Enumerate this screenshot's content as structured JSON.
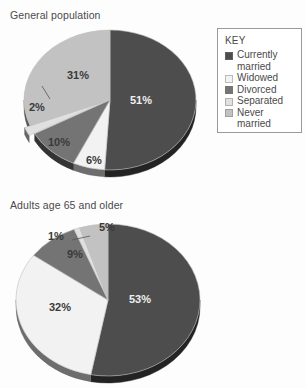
{
  "document": {
    "background": "#fdfdfd"
  },
  "legend": {
    "name": "KEY",
    "title": "KEY",
    "items": [
      {
        "label": "Currently",
        "label2": "married",
        "full": "Currently married",
        "color": "#4d4d4d",
        "icon": "legend-swatch-currently-married"
      },
      {
        "label": "Widowed",
        "label2": "",
        "full": "Widowed",
        "color": "#f2f2f2",
        "icon": "legend-swatch-widowed"
      },
      {
        "label": "Divorced",
        "label2": "",
        "full": "Divorced",
        "color": "#747474",
        "icon": "legend-swatch-divorced"
      },
      {
        "label": "Separated",
        "label2": "",
        "full": "Separated",
        "color": "#e0e0e0",
        "icon": "legend-swatch-separated"
      },
      {
        "label": "Never",
        "label2": "married",
        "full": "Never married",
        "color": "#c2c2c2",
        "icon": "legend-swatch-never-married"
      }
    ]
  },
  "charts": {
    "top": {
      "title": "General population",
      "labels": [
        "51%",
        "6%",
        "10%",
        "2%",
        "31%"
      ]
    },
    "bottom": {
      "title": "Adults age 65 and older",
      "labels": [
        "53%",
        "32%",
        "9%",
        "1%",
        "5%"
      ]
    }
  },
  "chart_data": [
    {
      "type": "pie",
      "title": "General population",
      "categories": [
        "Currently married",
        "Widowed",
        "Divorced",
        "Separated",
        "Never married"
      ],
      "values": [
        51,
        6,
        10,
        2,
        31
      ],
      "data_labels": [
        "51%",
        "6%",
        "10%",
        "2%",
        "31%"
      ],
      "colors": [
        "#4d4d4d",
        "#f2f2f2",
        "#747474",
        "#e0e0e0",
        "#c2c2c2"
      ],
      "units": "percent",
      "legend": "KEY",
      "legend_position": "right",
      "three_d": true,
      "start_angle_deg": 0,
      "direction": "clockwise",
      "grid": false,
      "xlabel": "",
      "ylabel": ""
    },
    {
      "type": "pie",
      "title": "Adults age 65 and older",
      "categories": [
        "Currently married",
        "Widowed",
        "Divorced",
        "Separated",
        "Never married"
      ],
      "values": [
        53,
        32,
        9,
        1,
        5
      ],
      "data_labels": [
        "53%",
        "32%",
        "9%",
        "1%",
        "5%"
      ],
      "colors": [
        "#4d4d4d",
        "#f2f2f2",
        "#747474",
        "#e0e0e0",
        "#c2c2c2"
      ],
      "units": "percent",
      "legend": "KEY",
      "legend_position": "shared-with-top-chart",
      "three_d": true,
      "start_angle_deg": 0,
      "direction": "clockwise",
      "grid": false,
      "xlabel": "",
      "ylabel": ""
    }
  ]
}
